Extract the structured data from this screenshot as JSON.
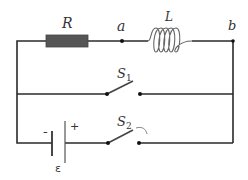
{
  "diagram": {
    "type": "circuit",
    "colors": {
      "wire": "#2a2a2a",
      "resistor": "#555555",
      "inductor": "#666666",
      "background": "#ffffff"
    },
    "components": {
      "resistor": {
        "label": "R"
      },
      "inductor": {
        "label": "L"
      },
      "switch1": {
        "label": "S",
        "subscript": "1",
        "state": "open"
      },
      "switch2": {
        "label": "S",
        "subscript": "2",
        "state": "open"
      },
      "battery": {
        "label": "ε",
        "negative": "-",
        "positive": "+"
      }
    },
    "nodes": {
      "a": {
        "label": "a"
      },
      "b": {
        "label": "b"
      }
    }
  }
}
